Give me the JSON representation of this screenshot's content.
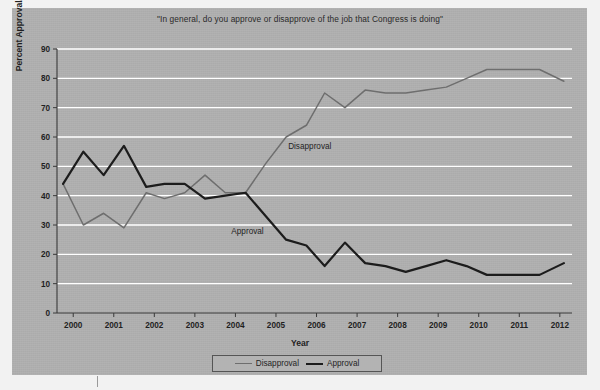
{
  "chart_data": {
    "type": "line",
    "title": "\"In general, do you approve or disapprove of the job that Congress is doing\"",
    "xlabel": "Year",
    "ylabel": "Percent Approval/Disapproval",
    "xlim": [
      1999.6,
      2012.3
    ],
    "ylim": [
      0,
      90
    ],
    "ytick_labels": [
      "0",
      "10",
      "20",
      "30",
      "40",
      "50",
      "60",
      "70",
      "80",
      "90"
    ],
    "ytick_values": [
      0,
      10,
      20,
      30,
      40,
      50,
      60,
      70,
      80,
      90
    ],
    "xtick_labels": [
      "2000",
      "2001",
      "2002",
      "2003",
      "2004",
      "2005",
      "2006",
      "2007",
      "2008",
      "2009",
      "2010",
      "2011",
      "2012"
    ],
    "xtick_values": [
      2000,
      2001,
      2002,
      2003,
      2004,
      2005,
      2006,
      2007,
      2008,
      2009,
      2010,
      2011,
      2012
    ],
    "grid": "horizontal-only",
    "legend_position": "below-axes",
    "annotations": [
      {
        "text": "Disapproval",
        "x": 2005.3,
        "y": 56
      },
      {
        "text": "Approval",
        "x": 2003.9,
        "y": 27
      }
    ],
    "series": [
      {
        "name": "Disapproval",
        "color": "#6e6e6e",
        "x": [
          1999.75,
          2000.25,
          2000.75,
          2001.25,
          2001.8,
          2002.25,
          2002.75,
          2003.25,
          2003.75,
          2004.25,
          2004.75,
          2005.25,
          2005.75,
          2006.2,
          2006.7,
          2007.2,
          2007.7,
          2008.2,
          2008.7,
          2009.2,
          2009.7,
          2010.2,
          2010.9,
          2011.5,
          2012.1
        ],
        "y": [
          44,
          30,
          34,
          29,
          41,
          39,
          41,
          47,
          41,
          41,
          51,
          60,
          64,
          75,
          70,
          76,
          75,
          75,
          76,
          77,
          80,
          83,
          83,
          83,
          79
        ]
      },
      {
        "name": "Approval",
        "color": "#1c1c1c",
        "x": [
          1999.75,
          2000.25,
          2000.75,
          2001.25,
          2001.8,
          2002.25,
          2002.75,
          2003.25,
          2003.75,
          2004.25,
          2004.75,
          2005.25,
          2005.75,
          2006.2,
          2006.7,
          2007.2,
          2007.7,
          2008.2,
          2008.7,
          2009.2,
          2009.7,
          2010.2,
          2010.9,
          2011.5,
          2012.1
        ],
        "y": [
          44,
          55,
          47,
          57,
          43,
          44,
          44,
          39,
          40,
          41,
          33,
          25,
          23,
          16,
          24,
          17,
          16,
          14,
          16,
          18,
          16,
          13,
          13,
          13,
          17
        ]
      }
    ]
  },
  "legend": {
    "items": [
      {
        "label": "Disapproval",
        "color": "#6e6e6e",
        "width": "1.5px"
      },
      {
        "label": "Approval",
        "color": "#1c1c1c",
        "width": "2.2px"
      }
    ]
  }
}
